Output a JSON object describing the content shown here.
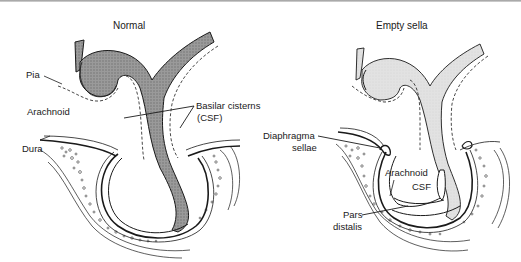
{
  "figure": {
    "panels": [
      {
        "id": "normal",
        "title": "Normal",
        "labels": {
          "pia": "Pia",
          "arachnoid": "Arachnoid",
          "basilar_cisterns_line1": "Basilar cisterns",
          "basilar_cisterns_line2": "(CSF)",
          "dura": "Dura"
        },
        "pituitary_fill": "#8c8c8c"
      },
      {
        "id": "empty-sella",
        "title": "Empty sella",
        "labels": {
          "diaphragma_line1": "Diaphragma",
          "diaphragma_line2": "sellae",
          "arachnoid": "Arachnoid",
          "csf": "CSF",
          "pars_line1": "Pars",
          "pars_line2": "distalis"
        },
        "pituitary_fill": "#dcdcdc"
      }
    ],
    "colors": {
      "line": "#1a1a1a",
      "background": "#ffffff"
    }
  }
}
